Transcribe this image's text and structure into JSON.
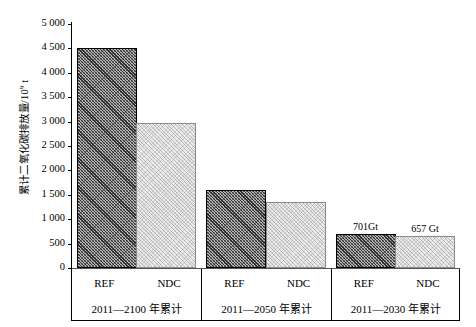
{
  "chart_data": {
    "type": "bar",
    "title": "",
    "xlabel": "",
    "ylabel": "累计二氧化碳排放量/10⁹ t",
    "ylabel_text": "累计二氧化碳排放量/10",
    "ylabel_exponent": "9",
    "ylabel_unit": " t",
    "ylim": [
      0,
      5000
    ],
    "ytick_labels": [
      "5 000",
      "4 500",
      "4 000",
      "3 500",
      "3 000",
      "2 500",
      "2 000",
      "1 500",
      "1 000",
      "500",
      "0"
    ],
    "ytick_values": [
      5000,
      4500,
      4000,
      3500,
      3000,
      2500,
      2000,
      1500,
      1000,
      500,
      0
    ],
    "grid": false,
    "legend": "none",
    "categories": [
      "2011—2100 年累计",
      "2011—2050 年累计",
      "2011—2030 年累计"
    ],
    "series": [
      {
        "name": "REF",
        "values": [
          4500,
          1600,
          701
        ]
      },
      {
        "name": "NDC",
        "values": [
          2980,
          1350,
          657
        ]
      }
    ],
    "groups": [
      {
        "period": "2011—2100 年累计",
        "bars": [
          {
            "series": "REF",
            "value": 4500,
            "label": ""
          },
          {
            "series": "NDC",
            "value": 2980,
            "label": ""
          }
        ]
      },
      {
        "period": "2011—2050 年累计",
        "bars": [
          {
            "series": "REF",
            "value": 1600,
            "label": ""
          },
          {
            "series": "NDC",
            "value": 1350,
            "label": ""
          }
        ]
      },
      {
        "period": "2011—2030 年累计",
        "bars": [
          {
            "series": "REF",
            "value": 701,
            "label": "701Gt"
          },
          {
            "series": "NDC",
            "value": 657,
            "label": "657 Gt"
          }
        ]
      }
    ],
    "colors": {
      "ref_fill": "#b9b9b9",
      "ref_edge": "#000000",
      "ndc_fill": "#ececec",
      "ndc_edge": "#8a8a8a",
      "axis": "#000000",
      "background": "#ffffff"
    }
  }
}
